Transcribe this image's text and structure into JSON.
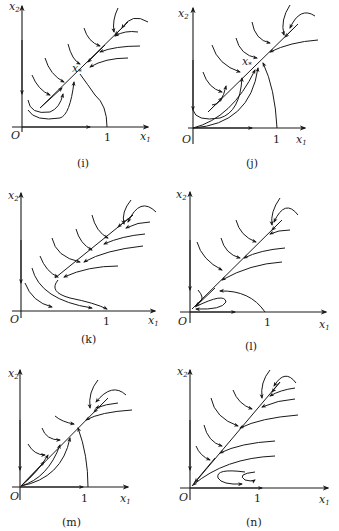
{
  "figure": {
    "panels": [
      {
        "id": "i",
        "caption": "(i)",
        "x_axis_label": "x",
        "x_axis_sub": "1",
        "y_axis_label": "x",
        "y_axis_sub": "2",
        "origin_label": "O",
        "tick_label": "1",
        "equilibrium_label": "x",
        "equilibrium_sub": "*"
      },
      {
        "id": "j",
        "caption": "(j)",
        "x_axis_label": "x",
        "x_axis_sub": "1",
        "y_axis_label": "x",
        "y_axis_sub": "2",
        "origin_label": "O",
        "tick_label": "1",
        "equilibrium_label": "x",
        "equilibrium_sub": "*"
      },
      {
        "id": "k",
        "caption": "(k)",
        "x_axis_label": "x",
        "x_axis_sub": "1",
        "y_axis_label": "x",
        "y_axis_sub": "2",
        "origin_label": "O",
        "tick_label": "1"
      },
      {
        "id": "l",
        "caption": "(l)",
        "x_axis_label": "x",
        "x_axis_sub": "1",
        "y_axis_label": "x",
        "y_axis_sub": "2",
        "origin_label": "O",
        "tick_label": "1"
      },
      {
        "id": "m",
        "caption": "(m)",
        "x_axis_label": "x",
        "x_axis_sub": "1",
        "y_axis_label": "x",
        "y_axis_sub": "2",
        "origin_label": "O",
        "tick_label": "1"
      },
      {
        "id": "n",
        "caption": "(n)",
        "x_axis_label": "x",
        "x_axis_sub": "1",
        "y_axis_label": "x",
        "y_axis_sub": "2",
        "origin_label": "O",
        "tick_label": "1"
      }
    ]
  }
}
